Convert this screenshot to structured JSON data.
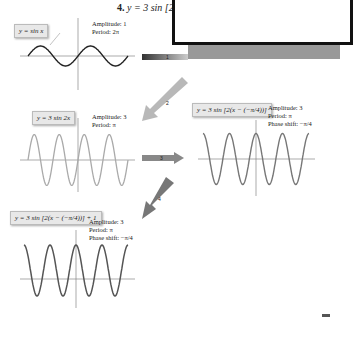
{
  "title": {
    "number": "4.",
    "equation": "y = 3 sin [2(x"
  },
  "graphs": [
    {
      "id": "g1",
      "equation": "y = sin x",
      "amplitude": "Amplitude: 1",
      "period": "Period: 2π",
      "phase_shift": ""
    },
    {
      "id": "g2",
      "equation": "y = 3 sin 2x",
      "amplitude": "Amplitude: 3",
      "period": "Period: π",
      "phase_shift": ""
    },
    {
      "id": "g3",
      "equation": "y = 3 sin [2(x − (−π/4))]",
      "amplitude": "Amplitude: 3",
      "period": "Period: π",
      "phase_shift": "Phase shift: −π/4"
    },
    {
      "id": "g4",
      "equation": "y = 3 sin [2(x − (−π/4))] + 1",
      "amplitude": "Amplitude: 3",
      "period": "Period: π",
      "phase_shift": "Phase shift: −π/4"
    }
  ],
  "arrows": [
    {
      "label": "1",
      "from": "g1",
      "to": "overlay"
    },
    {
      "label": "2",
      "from": "overlay",
      "to": "g2"
    },
    {
      "label": "3",
      "from": "g2",
      "to": "g3"
    },
    {
      "label": "4",
      "from": "g3",
      "to": "g4"
    }
  ],
  "axis_ticks": {
    "x": [
      "−2π",
      "−3π/2",
      "−π",
      "−π/2",
      "π/2",
      "π",
      "3π/2",
      "2π"
    ],
    "y": [
      "3",
      "2",
      "1",
      "−1",
      "−2",
      "−3"
    ],
    "x_label": "x",
    "y_label": "y"
  },
  "chart_data": [
    {
      "type": "line",
      "title": "y = sin x",
      "xlim": [
        -6.283,
        6.283
      ],
      "ylim": [
        -3,
        3
      ],
      "amplitude": 1,
      "period": "2π",
      "phase_shift": 0,
      "vertical_shift": 0
    },
    {
      "type": "line",
      "title": "y = 3 sin 2x",
      "xlim": [
        -6.283,
        6.283
      ],
      "ylim": [
        -3,
        3
      ],
      "amplitude": 3,
      "period": "π",
      "phase_shift": 0,
      "vertical_shift": 0
    },
    {
      "type": "line",
      "title": "y = 3 sin[2(x + π/4)]",
      "xlim": [
        -6.283,
        6.283
      ],
      "ylim": [
        -3,
        3
      ],
      "amplitude": 3,
      "period": "π",
      "phase_shift": "−π/4",
      "vertical_shift": 0
    },
    {
      "type": "line",
      "title": "y = 3 sin[2(x + π/4)] + 1",
      "xlim": [
        -6.283,
        6.283
      ],
      "ylim": [
        -3,
        4
      ],
      "amplitude": 3,
      "period": "π",
      "phase_shift": "−π/4",
      "vertical_shift": 1
    }
  ]
}
